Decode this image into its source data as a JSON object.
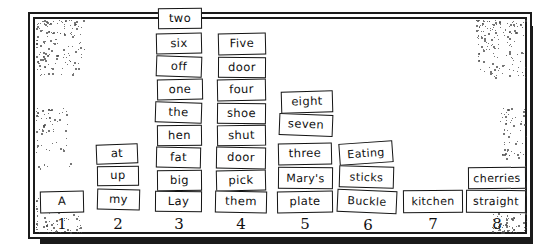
{
  "figure": {
    "frame_color": "#1b1b1b",
    "card_border_color": "#131313",
    "card_fill": "#ffffff",
    "speckle_color": "#4a4a4a"
  },
  "chart_data": {
    "type": "bar",
    "xlabel": "",
    "ylabel": "",
    "categories": [
      "1",
      "2",
      "3",
      "4",
      "5",
      "6",
      "7",
      "8"
    ],
    "values": [
      1,
      3,
      8,
      7,
      5,
      3,
      1,
      2
    ],
    "ylim": [
      0,
      8
    ],
    "grid": false,
    "legend": null,
    "note": "Each unit of bar height is one hand-drawn word card; cards stack bottom-up in each numbered column.",
    "columns": [
      {
        "number": "1",
        "count": 1,
        "cards": [
          "A"
        ]
      },
      {
        "number": "2",
        "count": 3,
        "cards": [
          "at",
          "up",
          "my"
        ]
      },
      {
        "number": "3",
        "count": 8,
        "cards": [
          "two",
          "six",
          "off",
          "one",
          "the",
          "hen",
          "fat",
          "big",
          "Lay"
        ]
      },
      {
        "number": "4",
        "count": 7,
        "cards": [
          "Five",
          "door",
          "four",
          "shoe",
          "shut",
          "door",
          "pick",
          "them"
        ]
      },
      {
        "number": "5",
        "count": 5,
        "cards": [
          "eight",
          "seven",
          "three",
          "Mary's",
          "plate"
        ]
      },
      {
        "number": "6",
        "count": 3,
        "cards": [
          "Eating",
          "sticks",
          "Buckle"
        ]
      },
      {
        "number": "7",
        "count": 1,
        "cards": [
          "kitchen"
        ]
      },
      {
        "number": "8",
        "count": 2,
        "cards": [
          "cherries",
          "straight"
        ]
      }
    ]
  },
  "cards": {
    "c3_two": "two",
    "c3_six": "six",
    "c3_off": "off",
    "c3_one": "one",
    "c3_the": "the",
    "c3_hen": "hen",
    "c3_fat": "fat",
    "c3_big": "big",
    "c3_lay": "Lay",
    "c4_five": "Five",
    "c4_door1": "door",
    "c4_four": "four",
    "c4_shoe": "shoe",
    "c4_shut": "shut",
    "c4_door2": "door",
    "c4_pick": "pick",
    "c4_them": "them",
    "c5_eight": "eight",
    "c5_seven": "seven",
    "c5_three": "three",
    "c5_marys": "Mary's",
    "c5_plate": "plate",
    "c6_eating": "Eating",
    "c6_sticks": "sticks",
    "c6_buckle": "Buckle",
    "c7_kitchen": "kitchen",
    "c8_cherries": "cherries",
    "c8_straight": "straight",
    "c2_at": "at",
    "c2_up": "up",
    "c2_my": "my",
    "c1_a": "A"
  },
  "axis_labels": {
    "n1": "1",
    "n2": "2",
    "n3": "3",
    "n4": "4",
    "n5": "5",
    "n6": "6",
    "n7": "7",
    "n8": "8"
  }
}
